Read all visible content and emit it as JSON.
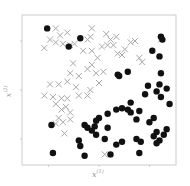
{
  "chart_data": {
    "type": "scatter",
    "title": "",
    "xlabel": "x(1)",
    "ylabel": "x(2)",
    "xlabel_base": "x",
    "xlabel_sup": "(1)",
    "ylabel_base": "x",
    "ylabel_sup": "(2)",
    "grid": false,
    "legend": null,
    "xlim": [
      0,
      1
    ],
    "ylim": [
      0,
      1
    ],
    "frame_px": {
      "left": 22,
      "top": 15,
      "right": 176,
      "bottom": 165
    },
    "colors": {
      "cross": "#a8a8a8",
      "dot": "#111111",
      "frame": "#cccccc"
    },
    "series": [
      {
        "name": "class-cross",
        "marker": "x",
        "points": [
          [
            0.2,
            0.94
          ],
          [
            0.28,
            0.91
          ],
          [
            0.45,
            0.94
          ],
          [
            0.44,
            0.88
          ],
          [
            0.16,
            0.86
          ],
          [
            0.23,
            0.89
          ],
          [
            0.2,
            0.84
          ],
          [
            0.25,
            0.83
          ],
          [
            0.3,
            0.82
          ],
          [
            0.33,
            0.83
          ],
          [
            0.12,
            0.8
          ],
          [
            0.42,
            0.86
          ],
          [
            0.45,
            0.78
          ],
          [
            0.39,
            0.78
          ],
          [
            0.49,
            0.73
          ],
          [
            0.55,
            0.9
          ],
          [
            0.58,
            0.86
          ],
          [
            0.62,
            0.88
          ],
          [
            0.6,
            0.82
          ],
          [
            0.52,
            0.81
          ],
          [
            0.56,
            0.82
          ],
          [
            0.63,
            0.76
          ],
          [
            0.66,
            0.75
          ],
          [
            0.68,
            0.79
          ],
          [
            0.72,
            0.84
          ],
          [
            0.75,
            0.85
          ],
          [
            0.8,
            0.7
          ],
          [
            0.78,
            0.73
          ],
          [
            0.32,
            0.69
          ],
          [
            0.42,
            0.65
          ],
          [
            0.36,
            0.6
          ],
          [
            0.3,
            0.62
          ],
          [
            0.48,
            0.62
          ],
          [
            0.53,
            0.63
          ],
          [
            0.45,
            0.68
          ],
          [
            0.16,
            0.54
          ],
          [
            0.22,
            0.54
          ],
          [
            0.28,
            0.56
          ],
          [
            0.34,
            0.52
          ],
          [
            0.44,
            0.5
          ],
          [
            0.5,
            0.55
          ],
          [
            0.42,
            0.46
          ],
          [
            0.12,
            0.46
          ],
          [
            0.18,
            0.45
          ],
          [
            0.24,
            0.44
          ],
          [
            0.28,
            0.44
          ],
          [
            0.36,
            0.46
          ],
          [
            0.2,
            0.4
          ],
          [
            0.27,
            0.38
          ],
          [
            0.24,
            0.36
          ],
          [
            0.3,
            0.34
          ],
          [
            0.22,
            0.3
          ],
          [
            0.25,
            0.27
          ],
          [
            0.3,
            0.29
          ],
          [
            0.2,
            0.26
          ],
          [
            0.26,
            0.19
          ],
          [
            0.93,
            0.86
          ],
          [
            0.54,
            0.04
          ]
        ]
      },
      {
        "name": "class-dot",
        "marker": "o",
        "points": [
          [
            0.14,
            0.94
          ],
          [
            0.29,
            0.81
          ],
          [
            0.37,
            0.87
          ],
          [
            0.93,
            0.88
          ],
          [
            0.94,
            0.86
          ],
          [
            0.87,
            0.78
          ],
          [
            0.92,
            0.74
          ],
          [
            0.63,
            0.61
          ],
          [
            0.7,
            0.63
          ],
          [
            0.64,
            0.6
          ],
          [
            0.93,
            0.62
          ],
          [
            0.93,
            0.45
          ],
          [
            0.82,
            0.47
          ],
          [
            0.9,
            0.49
          ],
          [
            0.97,
            0.51
          ],
          [
            0.84,
            0.53
          ],
          [
            0.92,
            0.54
          ],
          [
            0.72,
            0.41
          ],
          [
            0.66,
            0.37
          ],
          [
            0.62,
            0.36
          ],
          [
            0.72,
            0.34
          ],
          [
            0.88,
            0.3
          ],
          [
            0.85,
            0.27
          ],
          [
            0.76,
            0.29
          ],
          [
            0.78,
            0.35
          ],
          [
            0.7,
            0.36
          ],
          [
            0.56,
            0.33
          ],
          [
            0.48,
            0.28
          ],
          [
            0.47,
            0.24
          ],
          [
            0.5,
            0.3
          ],
          [
            0.42,
            0.23
          ],
          [
            0.4,
            0.25
          ],
          [
            0.45,
            0.21
          ],
          [
            0.48,
            0.18
          ],
          [
            0.56,
            0.23
          ],
          [
            0.54,
            0.15
          ],
          [
            0.62,
            0.11
          ],
          [
            0.66,
            0.13
          ],
          [
            0.76,
            0.15
          ],
          [
            0.79,
            0.13
          ],
          [
            0.92,
            0.14
          ],
          [
            0.9,
            0.12
          ],
          [
            0.88,
            0.17
          ],
          [
            0.78,
            0.05
          ],
          [
            0.58,
            0.04
          ],
          [
            0.4,
            0.03
          ],
          [
            0.37,
            0.1
          ],
          [
            0.36,
            0.14
          ],
          [
            0.17,
            0.25
          ],
          [
            0.9,
            0.2
          ],
          [
            0.95,
            0.18
          ],
          [
            0.97,
            0.22
          ],
          [
            0.99,
            0.4
          ],
          [
            0.18,
            0.05
          ]
        ]
      }
    ]
  }
}
